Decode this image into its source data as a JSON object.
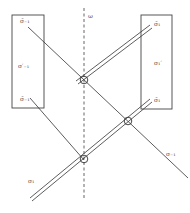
{
  "diagram": {
    "top_label": "ω",
    "left_box": {
      "top": "σ̄₋₁",
      "middle": "σ′₋₁",
      "bottom": "σ̄₋₁"
    },
    "right_box": {
      "top": "σ̄₁",
      "middle": "σ₁′",
      "bottom": "σ̄₁"
    },
    "bottom_left_label": "σ₁",
    "bottom_right_label": "σ₋₁",
    "colors": {
      "line": "#333333",
      "dashed_axis": "#555555",
      "label": "#555555"
    }
  }
}
